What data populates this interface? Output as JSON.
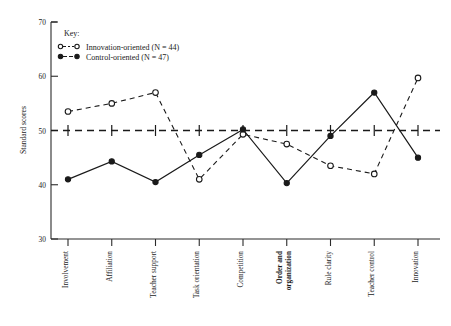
{
  "chart_data": {
    "type": "line",
    "title": "",
    "xlabel": "",
    "ylabel": "Standard scores",
    "ylim": [
      30,
      70
    ],
    "yticks": [
      30,
      40,
      50,
      60,
      70
    ],
    "grid": false,
    "legend_position": "top-left",
    "reference_line": {
      "value": 50,
      "style": "dashed"
    },
    "categories": [
      "Involvement",
      "Affiliation",
      "Teacher support",
      "Task orientation",
      "Competition",
      "Order and organization",
      "Rule clarity",
      "Teacher control",
      "Innovation"
    ],
    "categories_bold": [
      false,
      false,
      false,
      false,
      false,
      true,
      false,
      false,
      false
    ],
    "series": [
      {
        "name": "Innovation-oriented (N = 44)",
        "marker": "open-circle",
        "line": "dashed",
        "values": [
          53.5,
          55.0,
          57.0,
          41.0,
          49.3,
          47.5,
          43.5,
          42.0,
          59.7
        ]
      },
      {
        "name": "Control-oriented (N = 47)",
        "marker": "filled-circle",
        "line": "solid",
        "values": [
          41.0,
          44.3,
          40.5,
          45.5,
          50.2,
          40.3,
          49.0,
          57.0,
          45.0
        ]
      }
    ]
  },
  "legend": {
    "key_label": "Key:",
    "entries": [
      {
        "label": "Innovation-oriented (N = 44)",
        "marker": "open-circle",
        "line": "dashed"
      },
      {
        "label": "Control-oriented (N = 47)",
        "marker": "filled-circle",
        "line": "dashed"
      }
    ]
  },
  "axis": {
    "y_title": "Standard scores",
    "y_tick_labels": [
      "70",
      "60",
      "50",
      "40",
      "30"
    ]
  }
}
